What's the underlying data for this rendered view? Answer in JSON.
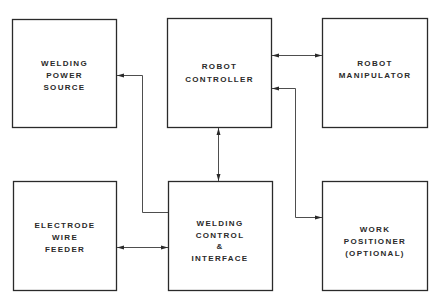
{
  "diagram": {
    "type": "block-diagram",
    "nodes": [
      {
        "id": "power",
        "lines": [
          "WELDING",
          "POWER",
          "SOURCE"
        ]
      },
      {
        "id": "controller",
        "lines": [
          "ROBOT",
          "CONTROLLER"
        ]
      },
      {
        "id": "manipulator",
        "lines": [
          "ROBOT",
          "MANIPULATOR"
        ]
      },
      {
        "id": "feeder",
        "lines": [
          "ELECTRODE",
          "WIRE",
          "FEEDER"
        ]
      },
      {
        "id": "weldctrl",
        "lines": [
          "WELDING",
          "CONTROL",
          "&",
          "INTERFACE"
        ]
      },
      {
        "id": "positioner",
        "lines": [
          "WORK",
          "POSITIONER",
          "(OPTIONAL)"
        ]
      }
    ],
    "edges": [
      {
        "from": "controller",
        "to": "manipulator",
        "direction": "bidirectional"
      },
      {
        "from": "controller",
        "to": "weldctrl",
        "direction": "bidirectional"
      },
      {
        "from": "feeder",
        "to": "weldctrl",
        "direction": "bidirectional"
      },
      {
        "from": "weldctrl",
        "to": "power",
        "direction": "forward"
      },
      {
        "from": "controller",
        "to": "positioner",
        "direction": "bidirectional"
      }
    ]
  }
}
